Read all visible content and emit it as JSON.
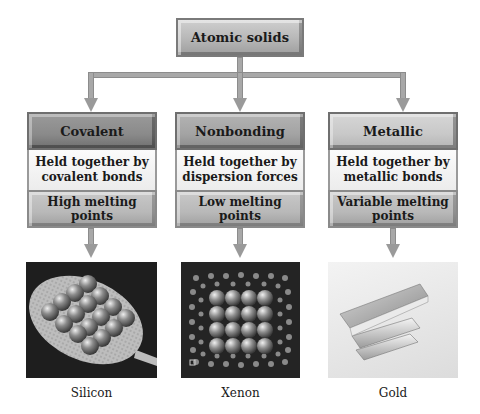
{
  "root": {
    "label": "Atomic solids"
  },
  "columns": [
    {
      "type": "Covalent",
      "description": [
        "Held together by",
        "covalent bonds"
      ],
      "property": [
        "High melting",
        "points"
      ],
      "example": "Silicon",
      "image_icon": "silicon-lattice-image"
    },
    {
      "type": "Nonbonding",
      "description": [
        "Held together by",
        "dispersion forces"
      ],
      "property": [
        "Low melting",
        "points"
      ],
      "example": "Xenon",
      "image_icon": "xenon-lattice-image"
    },
    {
      "type": "Metallic",
      "description": [
        "Held together by",
        "metallic bonds"
      ],
      "property": [
        "Variable melting",
        "points"
      ],
      "example": "Gold",
      "image_icon": "gold-bars-image"
    }
  ],
  "colors": {
    "box_dark": "#8a8a8a",
    "box_mid": "#a3a3a3",
    "box_light": "#c8c8c8",
    "connector": "#a8a8a8",
    "background": "#ffffff"
  }
}
